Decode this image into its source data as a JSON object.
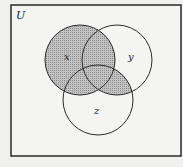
{
  "universe_label": "U",
  "sets": [
    {
      "label": "x",
      "cx": 80,
      "cy": 60,
      "r": 35
    },
    {
      "label": "y",
      "cx": 117,
      "cy": 60,
      "r": 35
    },
    {
      "label": "z",
      "cx": 98,
      "cy": 100,
      "r": 35
    }
  ],
  "shaded_region": "X ∪ (Y ∩ Z)",
  "colors": {
    "background": "#f0f0ee",
    "stroke": "#2a2a2a",
    "shade": "#b8b8b8"
  }
}
